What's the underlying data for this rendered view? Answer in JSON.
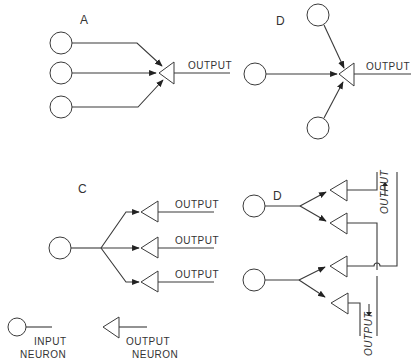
{
  "diagram": {
    "type": "neural connection schematic",
    "panels": [
      {
        "id": "A",
        "label": "A",
        "description": "Convergence: three input neurons connect to one output neuron",
        "inputs": 3,
        "outputs": 1,
        "output_labels": [
          "OUTPUT"
        ]
      },
      {
        "id": "D_top",
        "label": "D",
        "description": "Convergence from three directions onto one output neuron",
        "inputs": 3,
        "outputs": 1,
        "output_labels": [
          "OUTPUT"
        ]
      },
      {
        "id": "C",
        "label": "C",
        "description": "Divergence: one input neuron branches to three output neurons",
        "inputs": 1,
        "outputs": 3,
        "output_labels": [
          "OUTPUT",
          "OUTPUT",
          "OUTPUT"
        ]
      },
      {
        "id": "D_bottom",
        "label": "D",
        "description": "Two input neurons each diverging to two output neurons, with cross-wired outputs",
        "inputs": 2,
        "outputs": 4,
        "output_labels": [
          "OUTPUT",
          "OUTPUT"
        ]
      }
    ],
    "legend": {
      "input_neuron": {
        "line1": "INPUT",
        "line2": "NEURON",
        "symbol": "circle"
      },
      "output_neuron": {
        "line1": "OUTPUT",
        "line2": "NEURON",
        "symbol": "triangle"
      }
    },
    "colors": {
      "line": "#3a3a3a",
      "background": "#ffffff",
      "text": "#333333"
    }
  }
}
